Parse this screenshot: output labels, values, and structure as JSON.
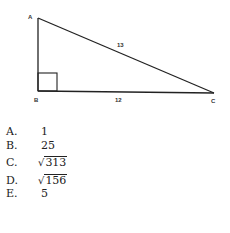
{
  "diagram": {
    "vertices": {
      "A": "A",
      "B": "B",
      "C": "C"
    },
    "sides": {
      "AC": "13",
      "BC": "12"
    },
    "right_angle_at": "B"
  },
  "choices": [
    {
      "letter": "A.",
      "value": "1",
      "sqrt": false
    },
    {
      "letter": "B.",
      "value": "25",
      "sqrt": false
    },
    {
      "letter": "C.",
      "value": "313",
      "sqrt": true
    },
    {
      "letter": "D.",
      "value": "156",
      "sqrt": true
    },
    {
      "letter": "E.",
      "value": "5",
      "sqrt": false
    }
  ]
}
